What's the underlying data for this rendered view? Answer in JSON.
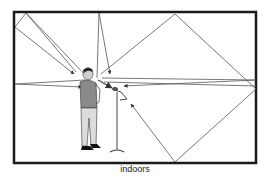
{
  "caption": "indoors",
  "colors": {
    "wall": "#1a1a1a",
    "ray": "#555555",
    "shirt": "#8a8a8a",
    "trousers": "#d8d8d8",
    "hair": "#2a2a2a",
    "stand": "#444444"
  },
  "room": {
    "x": 13,
    "y": 11,
    "width": 243,
    "height": 152
  },
  "speaker": {
    "label": "person",
    "x": 88,
    "y": 70
  },
  "microphone": {
    "label": "microphone-on-stand",
    "x": 118,
    "y": 90
  }
}
